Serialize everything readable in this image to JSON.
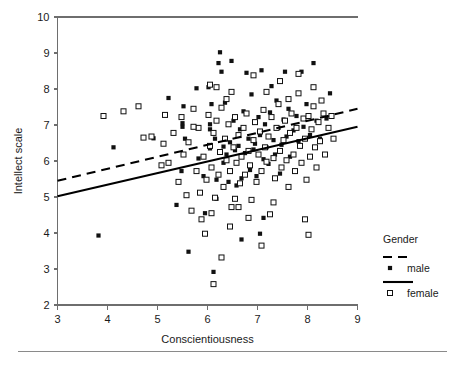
{
  "chart_data": {
    "type": "scatter",
    "title": "",
    "xlabel": "Conscientiousness",
    "ylabel": "Intellect scale",
    "xlim": [
      3,
      9
    ],
    "ylim": [
      2,
      10
    ],
    "xticks": [
      3,
      4,
      5,
      6,
      7,
      8,
      9
    ],
    "yticks": [
      2,
      3,
      4,
      5,
      6,
      7,
      8,
      9,
      10
    ],
    "grid": false,
    "legend": {
      "title": "Gender",
      "position": "right-bottom",
      "entries": [
        {
          "name": "male",
          "marker": "filled-square",
          "line": "dashed"
        },
        {
          "name": "female",
          "marker": "open-square",
          "line": "solid"
        }
      ]
    },
    "fit_lines": [
      {
        "name": "male",
        "style": "dashed",
        "x": [
          3,
          9
        ],
        "y": [
          5.45,
          7.45
        ]
      },
      {
        "name": "female",
        "style": "solid",
        "x": [
          3,
          9
        ],
        "y": [
          5.02,
          6.95
        ]
      }
    ],
    "series": [
      {
        "name": "male",
        "marker": "filled-square",
        "points": [
          [
            3.82,
            3.93
          ],
          [
            4.12,
            6.38
          ],
          [
            4.92,
            6.63
          ],
          [
            5.22,
            7.75
          ],
          [
            5.48,
            5.72
          ],
          [
            5.5,
            6.95
          ],
          [
            5.5,
            7.05
          ],
          [
            5.52,
            7.52
          ],
          [
            5.55,
            6.62
          ],
          [
            5.62,
            3.48
          ],
          [
            5.78,
            8.02
          ],
          [
            5.82,
            6.07
          ],
          [
            5.92,
            5.58
          ],
          [
            5.95,
            4.55
          ],
          [
            6.02,
            8.05
          ],
          [
            6.05,
            6.35
          ],
          [
            6.08,
            7.58
          ],
          [
            6.12,
            2.92
          ],
          [
            6.15,
            6.62
          ],
          [
            6.18,
            5.48
          ],
          [
            6.22,
            8.72
          ],
          [
            6.25,
            9.02
          ],
          [
            6.28,
            8.48
          ],
          [
            6.32,
            6.4
          ],
          [
            6.35,
            7.62
          ],
          [
            6.38,
            6.18
          ],
          [
            6.42,
            5.42
          ],
          [
            6.45,
            6.52
          ],
          [
            6.48,
            8.78
          ],
          [
            6.52,
            7.12
          ],
          [
            6.55,
            6.3
          ],
          [
            6.58,
            5.32
          ],
          [
            6.62,
            6.42
          ],
          [
            6.65,
            6.88
          ],
          [
            6.68,
            5.52
          ],
          [
            6.72,
            7.38
          ],
          [
            6.75,
            6.22
          ],
          [
            6.78,
            8.45
          ],
          [
            6.82,
            6.62
          ],
          [
            6.85,
            5.75
          ],
          [
            6.88,
            7.85
          ],
          [
            6.92,
            6.32
          ],
          [
            6.95,
            6.48
          ],
          [
            6.98,
            5.58
          ],
          [
            7.02,
            7.22
          ],
          [
            7.05,
            6.72
          ],
          [
            7.08,
            8.52
          ],
          [
            7.12,
            6.05
          ],
          [
            7.15,
            7.02
          ],
          [
            7.18,
            6.38
          ],
          [
            7.22,
            5.92
          ],
          [
            7.25,
            7.35
          ],
          [
            7.28,
            8.08
          ],
          [
            7.32,
            6.58
          ],
          [
            7.35,
            6.18
          ],
          [
            7.38,
            7.68
          ],
          [
            7.42,
            6.92
          ],
          [
            7.45,
            5.65
          ],
          [
            7.48,
            6.45
          ],
          [
            7.52,
            7.15
          ],
          [
            7.55,
            8.48
          ],
          [
            7.58,
            6.68
          ],
          [
            7.62,
            7.45
          ],
          [
            7.65,
            6.12
          ],
          [
            7.72,
            6.85
          ],
          [
            7.78,
            7.25
          ],
          [
            7.82,
            6.55
          ],
          [
            7.88,
            8.48
          ],
          [
            7.92,
            6.95
          ],
          [
            7.98,
            7.58
          ],
          [
            8.05,
            6.72
          ],
          [
            8.12,
            8.72
          ],
          [
            8.18,
            7.12
          ],
          [
            8.25,
            6.62
          ],
          [
            8.38,
            7.18
          ],
          [
            8.45,
            7.88
          ],
          [
            6.05,
            6.88
          ],
          [
            6.05,
            7.02
          ],
          [
            6.32,
            5.95
          ],
          [
            5.38,
            4.78
          ],
          [
            6.68,
            3.82
          ],
          [
            7.05,
            3.98
          ],
          [
            7.12,
            4.42
          ],
          [
            6.18,
            4.95
          ]
        ]
      },
      {
        "name": "female",
        "marker": "open-square",
        "points": [
          [
            3.92,
            7.25
          ],
          [
            4.32,
            7.38
          ],
          [
            4.62,
            7.52
          ],
          [
            4.72,
            6.65
          ],
          [
            5.08,
            5.88
          ],
          [
            5.12,
            6.48
          ],
          [
            5.22,
            5.95
          ],
          [
            5.32,
            6.78
          ],
          [
            5.42,
            5.42
          ],
          [
            5.48,
            7.22
          ],
          [
            5.52,
            6.18
          ],
          [
            5.58,
            5.05
          ],
          [
            5.62,
            6.52
          ],
          [
            5.68,
            4.62
          ],
          [
            5.72,
            7.45
          ],
          [
            5.78,
            5.72
          ],
          [
            5.82,
            6.92
          ],
          [
            5.88,
            4.38
          ],
          [
            5.92,
            6.12
          ],
          [
            5.98,
            5.48
          ],
          [
            6.02,
            7.28
          ],
          [
            6.05,
            6.42
          ],
          [
            6.08,
            5.82
          ],
          [
            6.12,
            6.78
          ],
          [
            6.15,
            4.98
          ],
          [
            6.18,
            7.12
          ],
          [
            6.22,
            5.62
          ],
          [
            6.25,
            6.25
          ],
          [
            6.28,
            7.48
          ],
          [
            6.32,
            5.28
          ],
          [
            6.35,
            6.62
          ],
          [
            6.38,
            6.02
          ],
          [
            6.42,
            7.02
          ],
          [
            6.45,
            5.72
          ],
          [
            6.48,
            4.72
          ],
          [
            6.52,
            6.38
          ],
          [
            6.55,
            7.22
          ],
          [
            6.58,
            5.95
          ],
          [
            6.62,
            6.72
          ],
          [
            6.65,
            5.38
          ],
          [
            6.68,
            6.12
          ],
          [
            6.72,
            6.92
          ],
          [
            6.75,
            5.62
          ],
          [
            6.78,
            7.32
          ],
          [
            6.82,
            6.28
          ],
          [
            6.85,
            5.88
          ],
          [
            6.88,
            4.92
          ],
          [
            6.92,
            6.58
          ],
          [
            6.95,
            7.08
          ],
          [
            6.98,
            5.42
          ],
          [
            7.02,
            6.18
          ],
          [
            7.05,
            6.82
          ],
          [
            7.08,
            5.72
          ],
          [
            7.12,
            7.42
          ],
          [
            7.15,
            6.38
          ],
          [
            7.18,
            5.98
          ],
          [
            7.22,
            6.68
          ],
          [
            7.25,
            4.52
          ],
          [
            7.28,
            7.22
          ],
          [
            7.32,
            6.08
          ],
          [
            7.35,
            5.52
          ],
          [
            7.38,
            6.92
          ],
          [
            7.42,
            7.58
          ],
          [
            7.45,
            6.28
          ],
          [
            7.48,
            5.82
          ],
          [
            7.52,
            6.58
          ],
          [
            7.55,
            7.12
          ],
          [
            7.58,
            6.02
          ],
          [
            7.62,
            5.28
          ],
          [
            7.65,
            6.78
          ],
          [
            7.68,
            7.32
          ],
          [
            7.72,
            6.18
          ],
          [
            7.75,
            5.72
          ],
          [
            7.78,
            6.92
          ],
          [
            7.82,
            7.88
          ],
          [
            7.85,
            6.42
          ],
          [
            7.88,
            5.95
          ],
          [
            7.92,
            7.18
          ],
          [
            7.95,
            6.62
          ],
          [
            7.98,
            5.48
          ],
          [
            8.02,
            7.25
          ],
          [
            8.05,
            6.12
          ],
          [
            8.08,
            6.88
          ],
          [
            8.12,
            7.52
          ],
          [
            8.15,
            6.38
          ],
          [
            8.18,
            5.82
          ],
          [
            8.22,
            7.08
          ],
          [
            8.25,
            6.55
          ],
          [
            8.32,
            7.32
          ],
          [
            8.35,
            6.18
          ],
          [
            8.42,
            6.92
          ],
          [
            8.48,
            7.25
          ],
          [
            8.52,
            6.62
          ],
          [
            5.95,
            3.98
          ],
          [
            6.12,
            2.58
          ],
          [
            6.28,
            3.32
          ],
          [
            6.45,
            4.18
          ],
          [
            6.62,
            4.72
          ],
          [
            6.82,
            4.42
          ],
          [
            7.08,
            3.65
          ],
          [
            7.95,
            4.38
          ],
          [
            8.02,
            3.95
          ],
          [
            4.88,
            6.68
          ],
          [
            5.15,
            7.28
          ],
          [
            6.05,
            8.12
          ],
          [
            6.18,
            8.05
          ],
          [
            6.48,
            7.92
          ],
          [
            6.92,
            8.38
          ],
          [
            7.18,
            7.92
          ],
          [
            7.45,
            8.22
          ],
          [
            7.82,
            8.42
          ],
          [
            8.12,
            8.05
          ],
          [
            5.85,
            5.12
          ],
          [
            6.08,
            4.55
          ],
          [
            6.55,
            4.95
          ],
          [
            7.32,
            4.85
          ],
          [
            5.72,
            6.95
          ],
          [
            6.38,
            7.72
          ],
          [
            7.62,
            7.72
          ],
          [
            8.28,
            7.68
          ]
        ]
      }
    ]
  }
}
